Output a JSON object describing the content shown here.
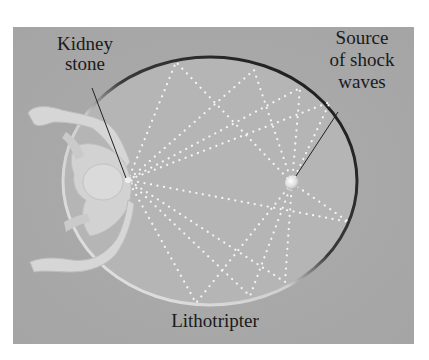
{
  "figure": {
    "title": "Lithotripter",
    "labels": {
      "kidney_stone": [
        "Kidney",
        "stone"
      ],
      "source": [
        "Source",
        "of shock",
        "waves"
      ],
      "device": "Lithotripter"
    },
    "colors": {
      "page_background": "#ffffff",
      "panel_background": "#a9a9a9",
      "ellipse_fill": "#b6b6b6",
      "rim_dark": "#1e1e1e",
      "rim_light": "#e4e4e4",
      "rays": "#f4f4f4",
      "figure_body": "#d9d9d9",
      "leader_lines": "#222222",
      "text": "#1a1a1a"
    },
    "geometry": {
      "panel": {
        "x": 13,
        "y": 27,
        "w": 401,
        "h": 317
      },
      "ellipse": {
        "cx": 210,
        "cy": 181,
        "rx": 147,
        "ry": 124
      },
      "focus_stone": {
        "x": 128,
        "y": 180
      },
      "focus_source": {
        "x": 292,
        "y": 183
      }
    }
  }
}
